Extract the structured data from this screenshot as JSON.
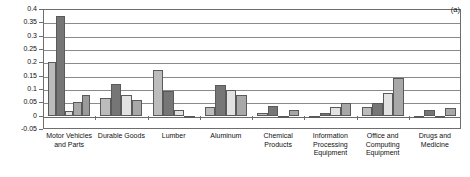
{
  "chart_data": {
    "type": "bar",
    "title": "",
    "subtitle": "",
    "xlabel": "",
    "ylabel": "",
    "annotation": "(a)",
    "ylim": [
      -0.05,
      0.4
    ],
    "ytick_values": [
      0.4,
      0.35,
      0.3,
      0.25,
      0.2,
      0.15,
      0.1,
      0.05,
      0,
      -0.05
    ],
    "ytick_labels": [
      "0.4",
      "0.35",
      "0.3",
      "0.25",
      "0.2",
      "0.15",
      "0.1",
      "0.05",
      "0",
      "-0.05"
    ],
    "grid": true,
    "grid_axis": "y",
    "legend": "none",
    "legend_position": "none",
    "categories": [
      "Motor Vehicles and Parts",
      "Durable Goods",
      "Lumber",
      "Aluminum",
      "Chemical Products",
      "Information Processing Equipment",
      "Office and Computing Equipment",
      "Drugs and Medicine"
    ],
    "category_label_lines": [
      [
        "Motor Vehicles",
        "and Parts"
      ],
      [
        "Durable Goods"
      ],
      [
        "Lumber"
      ],
      [
        "Aluminum"
      ],
      [
        "Chemical",
        "Products"
      ],
      [
        "Information",
        "Processing",
        "Equipment"
      ],
      [
        "Office and",
        "Computing",
        "Equipment"
      ],
      [
        "Drugs and",
        "Medicine"
      ]
    ],
    "series": [
      {
        "name": "s1",
        "color": "#bcbcbc",
        "values": [
          0.2,
          0.068,
          0.17,
          0.034,
          0.01,
          -0.008,
          0.034,
          -0.004
        ]
      },
      {
        "name": "s2",
        "color": "#767676",
        "values": [
          0.375,
          0.118,
          0.092,
          0.115,
          0.038,
          0.011,
          0.046,
          0.021
        ]
      },
      {
        "name": "s3",
        "color": "#e2e2e2",
        "values": [
          0.017,
          0.077,
          0.02,
          0.095,
          -0.004,
          0.034,
          0.086,
          -0.01
        ]
      },
      {
        "name": "s4",
        "color": "#a8a8a8",
        "values": [
          0.05,
          0.057,
          -0.003,
          0.077,
          0.022,
          0.047,
          0.141,
          0.03
        ]
      },
      {
        "name": "s5",
        "color": "#9a9a9a",
        "values": [
          0.077,
          null,
          null,
          null,
          null,
          null,
          null,
          null
        ]
      }
    ],
    "group_bar_counts": [
      5,
      4,
      4,
      4,
      4,
      4,
      4,
      4
    ]
  }
}
